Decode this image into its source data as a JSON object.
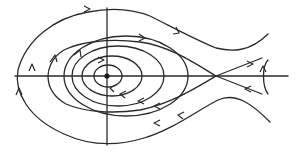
{
  "diagram": {
    "type": "phase-portrait",
    "colors": {
      "stroke": "#2a2a2a",
      "background": "#ffffff"
    },
    "axes": {
      "horizontal": {
        "x1": 15,
        "x2": 288,
        "y": 76
      },
      "vertical": {
        "x": 107,
        "y1": 8,
        "y2": 145
      }
    },
    "fixed_points": [
      {
        "kind": "center",
        "x": 107,
        "y": 76
      },
      {
        "kind": "saddle",
        "x": 216,
        "y": 76
      }
    ]
  }
}
